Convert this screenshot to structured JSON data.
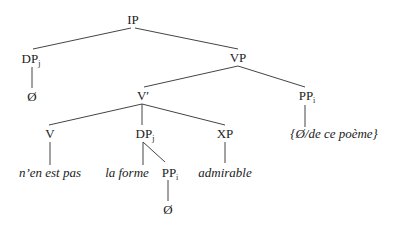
{
  "diagram": {
    "type": "syntax-tree",
    "nodes": {
      "ip": {
        "label": "IP",
        "sub": ""
      },
      "dp_subj": {
        "label": "DP",
        "sub": "j"
      },
      "null_subj": {
        "label": "Ø",
        "sub": ""
      },
      "vp": {
        "label": "VP",
        "sub": ""
      },
      "vbar": {
        "label": "V′",
        "sub": ""
      },
      "pp_right": {
        "label": "PP",
        "sub": "i"
      },
      "v": {
        "label": "V",
        "sub": ""
      },
      "dp_obj": {
        "label": "DP",
        "sub": "j"
      },
      "xp": {
        "label": "XP",
        "sub": ""
      },
      "v_word": {
        "label": "n’en est pas",
        "sub": ""
      },
      "la_forme": {
        "label": "la forme",
        "sub": ""
      },
      "pp_inner": {
        "label": "PP",
        "sub": "i"
      },
      "admirable": {
        "label": "admirable",
        "sub": ""
      },
      "pp_right_content": {
        "label": "{Ø/de ce poème}",
        "sub": ""
      },
      "null_pp": {
        "label": "Ø",
        "sub": ""
      }
    },
    "edges": [
      [
        "ip",
        "dp_subj"
      ],
      [
        "ip",
        "vp"
      ],
      [
        "dp_subj",
        "null_subj"
      ],
      [
        "vp",
        "vbar"
      ],
      [
        "vp",
        "pp_right"
      ],
      [
        "vbar",
        "v"
      ],
      [
        "vbar",
        "dp_obj"
      ],
      [
        "vbar",
        "xp"
      ],
      [
        "v",
        "v_word"
      ],
      [
        "dp_obj",
        "la_forme"
      ],
      [
        "dp_obj",
        "pp_inner"
      ],
      [
        "xp",
        "admirable"
      ],
      [
        "pp_right",
        "pp_right_content"
      ],
      [
        "pp_inner",
        "null_pp"
      ]
    ]
  }
}
